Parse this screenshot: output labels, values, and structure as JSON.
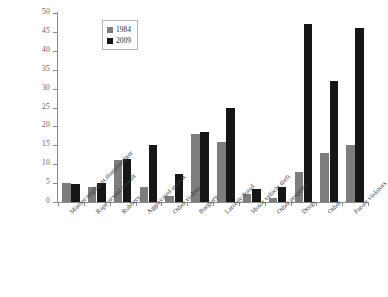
{
  "chart_data": {
    "type": "bar",
    "title": "",
    "subtitle": "",
    "xlabel": "",
    "ylabel": "",
    "ylim": [
      0,
      50
    ],
    "ytick_step": 5,
    "yticks": [
      "0",
      "5",
      "10",
      "15",
      "20",
      "25",
      "30",
      "35",
      "40",
      "45",
      "50"
    ],
    "grid": false,
    "legend_position": "top-left-inside",
    "categories": [
      "Murder/negligent manslaughter",
      "Rape/sexual assault",
      "Robbery",
      "Aggravated assault",
      "Other violent",
      "Burglary",
      "Larceny/fraud",
      "Motor vehicle theft",
      "Other property",
      "Drugs",
      "Other",
      "Parole violators"
    ],
    "series": [
      {
        "name": "1984",
        "color": "#7d7d7d",
        "values": [
          5.0,
          4.0,
          11.0,
          4.0,
          1.5,
          18.0,
          16.0,
          2.0,
          1.0,
          8.0,
          13.0,
          15.0
        ]
      },
      {
        "name": "2009",
        "color": "#161616",
        "values": [
          4.8,
          5.0,
          11.5,
          15.0,
          7.5,
          18.5,
          25.0,
          3.5,
          4.0,
          47.0,
          32.0,
          46.0
        ]
      }
    ]
  },
  "legend": {
    "entries": [
      {
        "label": "1984",
        "swatch": "gray-square-icon"
      },
      {
        "label": "2009",
        "swatch": "black-square-icon"
      }
    ]
  }
}
